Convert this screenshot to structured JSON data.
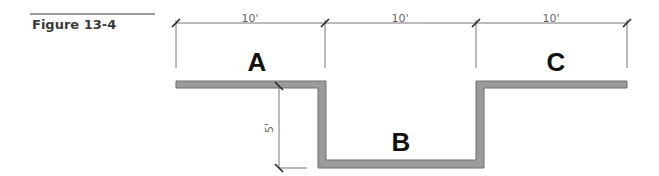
{
  "figure": {
    "label": "Figure 13-4"
  },
  "diagram": {
    "regions": [
      {
        "id": "A",
        "label": "A"
      },
      {
        "id": "B",
        "label": "B"
      },
      {
        "id": "C",
        "label": "C"
      }
    ],
    "dimensions": {
      "horizontal": [
        "10'",
        "10'",
        "10'"
      ],
      "vertical": "5'"
    },
    "colors": {
      "profile_fill": "#9b9b9b",
      "profile_stroke": "#6e6e6e",
      "dimension_line": "#777777",
      "text": "#111111"
    }
  }
}
